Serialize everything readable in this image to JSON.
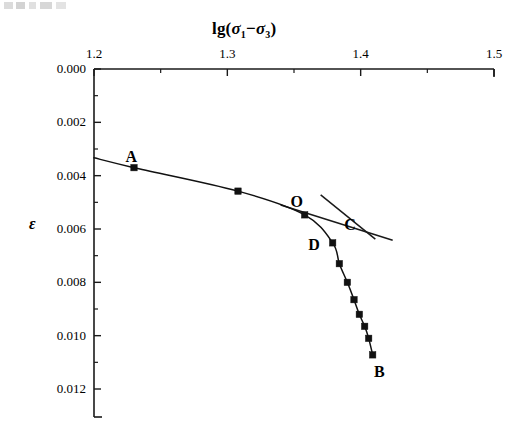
{
  "chart_data": {
    "type": "line",
    "title_parts": {
      "prefix": "lg(",
      "sym1": "σ",
      "sub1": "1",
      "operator": "−",
      "sym2": "σ",
      "sub2": "3",
      "suffix": ")"
    },
    "xlabel": "lg(σ₁−σ₃)",
    "ylabel": "ε",
    "x_axis_position": "top",
    "y_axis_inverted": true,
    "grid": false,
    "legend": null,
    "xlim": [
      1.2,
      1.5
    ],
    "ylim": [
      0.0,
      0.012
    ],
    "x_ticks": [
      "1.2",
      "1.3",
      "1.4",
      "1.5"
    ],
    "x_tick_values": [
      1.2,
      1.3,
      1.4,
      1.5
    ],
    "x_minor_tick_values": [
      1.25,
      1.35,
      1.45
    ],
    "y_ticks": [
      "0.000",
      "0.002",
      "0.004",
      "0.006",
      "0.008",
      "0.010",
      "0.012"
    ],
    "y_tick_values": [
      0.0,
      0.002,
      0.004,
      0.006,
      0.008,
      0.01,
      0.012
    ],
    "y_minor_tick_values": [
      0.001,
      0.003,
      0.005,
      0.007,
      0.009,
      0.011
    ],
    "series": [
      {
        "name": "strain-curve",
        "marker": "square",
        "color": "#111111",
        "x": [
          1.2,
          1.23,
          1.308,
          1.358,
          1.379,
          1.384,
          1.39,
          1.395,
          1.399,
          1.403,
          1.406,
          1.409
        ],
        "y": [
          0.00333,
          0.0037,
          0.00458,
          0.00547,
          0.00652,
          0.0073,
          0.008,
          0.00865,
          0.0092,
          0.00965,
          0.0101,
          0.01072
        ],
        "markers_shown": [
          false,
          true,
          true,
          true,
          true,
          true,
          true,
          true,
          true,
          true,
          true,
          true
        ]
      }
    ],
    "tangent_lines": [
      {
        "name": "upper-tangent",
        "x": [
          1.37,
          1.411
        ],
        "y": [
          0.00472,
          0.00638
        ]
      },
      {
        "name": "lower-tangent",
        "x": [
          1.34,
          1.424
        ],
        "y": [
          0.0051,
          0.00642
        ]
      }
    ],
    "annotations": [
      {
        "label": "A",
        "x": 1.228,
        "y": 0.0033
      },
      {
        "label": "O",
        "x": 1.352,
        "y": 0.005
      },
      {
        "label": "C",
        "x": 1.392,
        "y": 0.00585
      },
      {
        "label": "D",
        "x": 1.365,
        "y": 0.0066
      },
      {
        "label": "B",
        "x": 1.414,
        "y": 0.01136
      }
    ]
  }
}
